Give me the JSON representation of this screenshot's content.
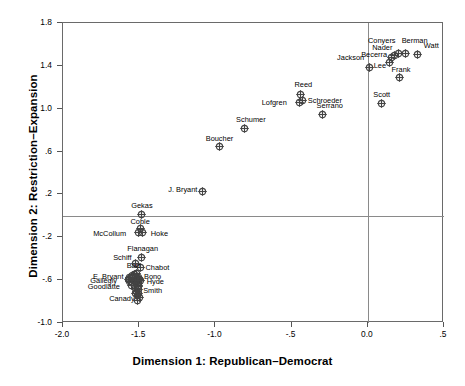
{
  "chart_data": {
    "type": "scatter",
    "title": "",
    "xlabel": "Dimension 1: Republican–Democrat",
    "ylabel": "Dimension 2: Restriction–Expansion",
    "xlim": [
      -2.0,
      0.5
    ],
    "ylim": [
      -1.0,
      1.8
    ],
    "xticks": [
      "-2.0",
      "-1.5",
      "-1.0",
      "-.5",
      "0.0",
      ".5"
    ],
    "xtick_values": [
      -2.0,
      -1.5,
      -1.0,
      -0.5,
      0.0,
      0.5
    ],
    "yticks": [
      "1.8",
      "1.4",
      "1.0",
      ".6",
      ".2",
      "-.2",
      "-.6",
      "-1.0"
    ],
    "ytick_values": [
      1.8,
      1.4,
      1.0,
      0.6,
      0.2,
      -0.2,
      -0.6,
      -1.0
    ],
    "grid": false,
    "legend": "none",
    "reference_lines": {
      "vertical_x": 0.0,
      "horizontal_y": 0.0
    },
    "marker_style": "crossed-circle",
    "points": [
      {
        "label": "Conyers",
        "x": 0.205,
        "y": 1.51,
        "lx": -30,
        "ly": -16
      },
      {
        "label": "Berman",
        "x": 0.255,
        "y": 1.51,
        "lx": -4,
        "ly": -16
      },
      {
        "label": "Watt",
        "x": 0.335,
        "y": 1.5,
        "lx": 6,
        "ly": -12
      },
      {
        "label": "Nader",
        "x": 0.18,
        "y": 1.49,
        "lx": -22,
        "ly": -11
      },
      {
        "label": "Becerra",
        "x": 0.16,
        "y": 1.47,
        "lx": -30,
        "ly": -6
      },
      {
        "label": "Jackson",
        "x": 0.015,
        "y": 1.375,
        "lx": -32,
        "ly": -14
      },
      {
        "label": "Lee",
        "x": 0.15,
        "y": 1.42,
        "lx": -16,
        "ly": -1
      },
      {
        "label": "Frank",
        "x": 0.215,
        "y": 1.28,
        "lx": -8,
        "ly": -12
      },
      {
        "label": "Scott",
        "x": 0.095,
        "y": 1.04,
        "lx": -8,
        "ly": -12
      },
      {
        "label": "Reed",
        "x": -0.435,
        "y": 1.125,
        "lx": -6,
        "ly": -13
      },
      {
        "label": "Schroeder",
        "x": -0.42,
        "y": 1.065,
        "lx": 5,
        "ly": -4
      },
      {
        "label": "Lofgren",
        "x": -0.44,
        "y": 1.045,
        "lx": -38,
        "ly": -4
      },
      {
        "label": "Serrano",
        "x": -0.29,
        "y": 0.94,
        "lx": -6,
        "ly": -12
      },
      {
        "label": "Schumer",
        "x": -0.805,
        "y": 0.81,
        "lx": -8,
        "ly": -12
      },
      {
        "label": "Boucher",
        "x": -0.965,
        "y": 0.635,
        "lx": -14,
        "ly": -12
      },
      {
        "label": "J. Bryant",
        "x": -1.08,
        "y": 0.22,
        "lx": -34,
        "ly": -5
      },
      {
        "label": "Gekas",
        "x": -1.48,
        "y": 0.005,
        "lx": -10,
        "ly": -12
      },
      {
        "label": "Coble",
        "x": -1.485,
        "y": -0.13,
        "lx": -10,
        "ly": -11
      },
      {
        "label": "McCollum",
        "x": -1.5,
        "y": -0.165,
        "lx": -45,
        "ly": -3
      },
      {
        "label": "Hoke",
        "x": -1.47,
        "y": -0.165,
        "lx": 8,
        "ly": -3
      },
      {
        "label": "Flanagan",
        "x": -1.48,
        "y": -0.395,
        "lx": -14,
        "ly": -12
      },
      {
        "label": "Schiff",
        "x": -1.52,
        "y": -0.45,
        "lx": -22,
        "ly": -9
      },
      {
        "label": "Chabot",
        "x": -1.485,
        "y": -0.49,
        "lx": 5,
        "ly": -3
      },
      {
        "label": "Barr",
        "x": -1.51,
        "y": -0.545,
        "lx": -10,
        "ly": -11
      },
      {
        "label": "E. Bryant",
        "x": -1.56,
        "y": -0.58,
        "lx": -36,
        "ly": -4
      },
      {
        "label": "Bono",
        "x": -1.495,
        "y": -0.58,
        "lx": 5,
        "ly": -4
      },
      {
        "label": "Gallegly",
        "x": -1.565,
        "y": -0.605,
        "lx": -38,
        "ly": -3
      },
      {
        "label": "Hyde",
        "x": -1.49,
        "y": -0.605,
        "lx": 7,
        "ly": -2
      },
      {
        "label": "Goodlatte",
        "x": -1.555,
        "y": -0.625,
        "lx": -42,
        "ly": 1
      },
      {
        "label": "Smith",
        "x": -1.5,
        "y": -0.66,
        "lx": 5,
        "ly": 1
      },
      {
        "label": "Canady",
        "x": -1.52,
        "y": -0.73,
        "lx": -26,
        "ly": 2
      },
      {
        "label": "",
        "x": -1.525,
        "y": -0.56,
        "lx": 0,
        "ly": 0
      },
      {
        "label": "",
        "x": -1.54,
        "y": -0.59,
        "lx": 0,
        "ly": 0
      },
      {
        "label": "",
        "x": -1.51,
        "y": -0.6,
        "lx": 0,
        "ly": 0
      },
      {
        "label": "",
        "x": -1.53,
        "y": -0.615,
        "lx": 0,
        "ly": 0
      },
      {
        "label": "",
        "x": -1.505,
        "y": -0.62,
        "lx": 0,
        "ly": 0
      },
      {
        "label": "",
        "x": -1.545,
        "y": -0.63,
        "lx": 0,
        "ly": 0
      },
      {
        "label": "",
        "x": -1.515,
        "y": -0.635,
        "lx": 0,
        "ly": 0
      },
      {
        "label": "",
        "x": -1.5,
        "y": -0.645,
        "lx": 0,
        "ly": 0
      },
      {
        "label": "",
        "x": -1.525,
        "y": -0.655,
        "lx": 0,
        "ly": 0
      },
      {
        "label": "",
        "x": -1.495,
        "y": -0.67,
        "lx": 0,
        "ly": 0
      },
      {
        "label": "",
        "x": -1.515,
        "y": -0.685,
        "lx": 0,
        "ly": 0
      },
      {
        "label": "",
        "x": -1.5,
        "y": -0.7,
        "lx": 0,
        "ly": 0
      },
      {
        "label": "",
        "x": -1.51,
        "y": -0.715,
        "lx": 0,
        "ly": 0
      },
      {
        "label": "",
        "x": -1.495,
        "y": -0.735,
        "lx": 0,
        "ly": 0
      },
      {
        "label": "",
        "x": -1.505,
        "y": -0.755,
        "lx": 0,
        "ly": 0
      },
      {
        "label": "",
        "x": -1.49,
        "y": -0.775,
        "lx": 0,
        "ly": 0
      },
      {
        "label": "",
        "x": -1.505,
        "y": -0.795,
        "lx": 0,
        "ly": 0
      },
      {
        "label": "",
        "x": -1.535,
        "y": -0.57,
        "lx": 0,
        "ly": 0
      },
      {
        "label": "",
        "x": -1.485,
        "y": -0.615,
        "lx": 0,
        "ly": 0
      },
      {
        "label": "",
        "x": -1.545,
        "y": -0.66,
        "lx": 0,
        "ly": 0
      }
    ]
  },
  "colors": {
    "frame": "#6a6a6a",
    "refline": "#8a8a8a",
    "marker": "#444444",
    "text": "#000000",
    "background": "#ffffff"
  }
}
